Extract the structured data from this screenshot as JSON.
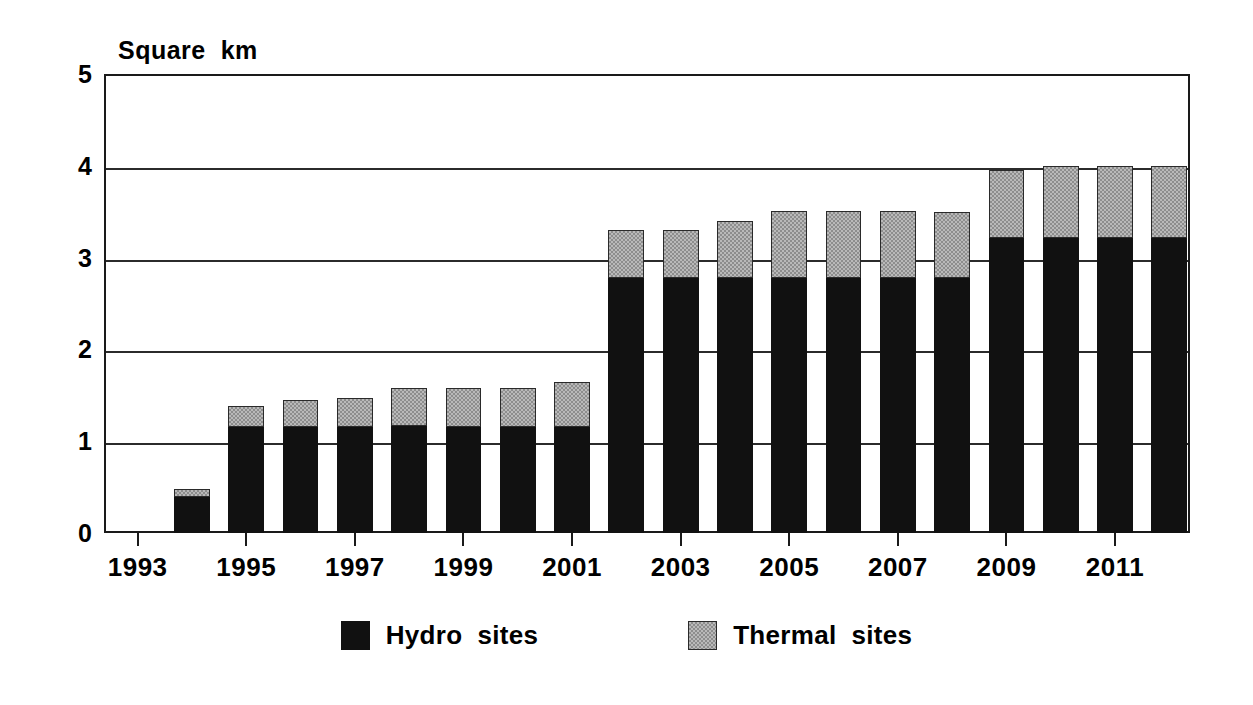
{
  "chart_data": {
    "type": "bar",
    "stacked": true,
    "title": "",
    "subtitle": "",
    "xlabel": "",
    "ylabel": "Square  km",
    "ylim": [
      0,
      5
    ],
    "yticks": [
      0,
      1,
      2,
      3,
      4,
      5
    ],
    "ytick_labels": [
      "0",
      "1",
      "2",
      "3",
      "4",
      "5"
    ],
    "grid": true,
    "grid_axis": "y",
    "legend_position": "bottom",
    "x": [
      1993,
      1994,
      1995,
      1996,
      1997,
      1998,
      1999,
      2000,
      2001,
      2002,
      2003,
      2004,
      2005,
      2006,
      2007,
      2008,
      2009,
      2010,
      2011,
      2012
    ],
    "categories": [
      "1993",
      "1994",
      "1995",
      "1996",
      "1997",
      "1998",
      "1999",
      "2000",
      "2001",
      "2002",
      "2003",
      "2004",
      "2005",
      "2006",
      "2007",
      "2008",
      "2009",
      "2010",
      "2011",
      "2012"
    ],
    "xtick_labels": [
      "1993",
      "1995",
      "1997",
      "1999",
      "2001",
      "2003",
      "2005",
      "2007",
      "2009",
      "2011"
    ],
    "xtick_values": [
      1993,
      1995,
      1997,
      1999,
      2001,
      2003,
      2005,
      2007,
      2009,
      2011
    ],
    "series": [
      {
        "name": "Hydro  sites",
        "color": "#111111",
        "fill": "solid-black",
        "values": [
          0,
          0.39,
          1.15,
          1.16,
          1.16,
          1.17,
          1.16,
          1.15,
          1.15,
          2.78,
          2.78,
          2.78,
          2.78,
          2.78,
          2.78,
          2.78,
          3.21,
          3.21,
          3.21,
          3.21
        ]
      },
      {
        "name": "Thermal  sites",
        "color": "#b9b9b9",
        "fill": "stippled-grey",
        "values": [
          0,
          0.09,
          0.23,
          0.29,
          0.31,
          0.41,
          0.42,
          0.43,
          0.5,
          0.52,
          0.52,
          0.62,
          0.73,
          0.73,
          0.73,
          0.72,
          0.74,
          0.79,
          0.79,
          0.79
        ]
      }
    ],
    "totals": [
      0,
      0.48,
      1.38,
      1.45,
      1.47,
      1.58,
      1.58,
      1.58,
      1.65,
      3.3,
      3.3,
      3.4,
      3.51,
      3.51,
      3.51,
      3.5,
      3.95,
      4.0,
      4.0,
      4.0
    ]
  },
  "legend": {
    "items": [
      {
        "label": "Hydro  sites",
        "swatch": "hydro"
      },
      {
        "label": "Thermal  sites",
        "swatch": "thermal"
      }
    ]
  }
}
